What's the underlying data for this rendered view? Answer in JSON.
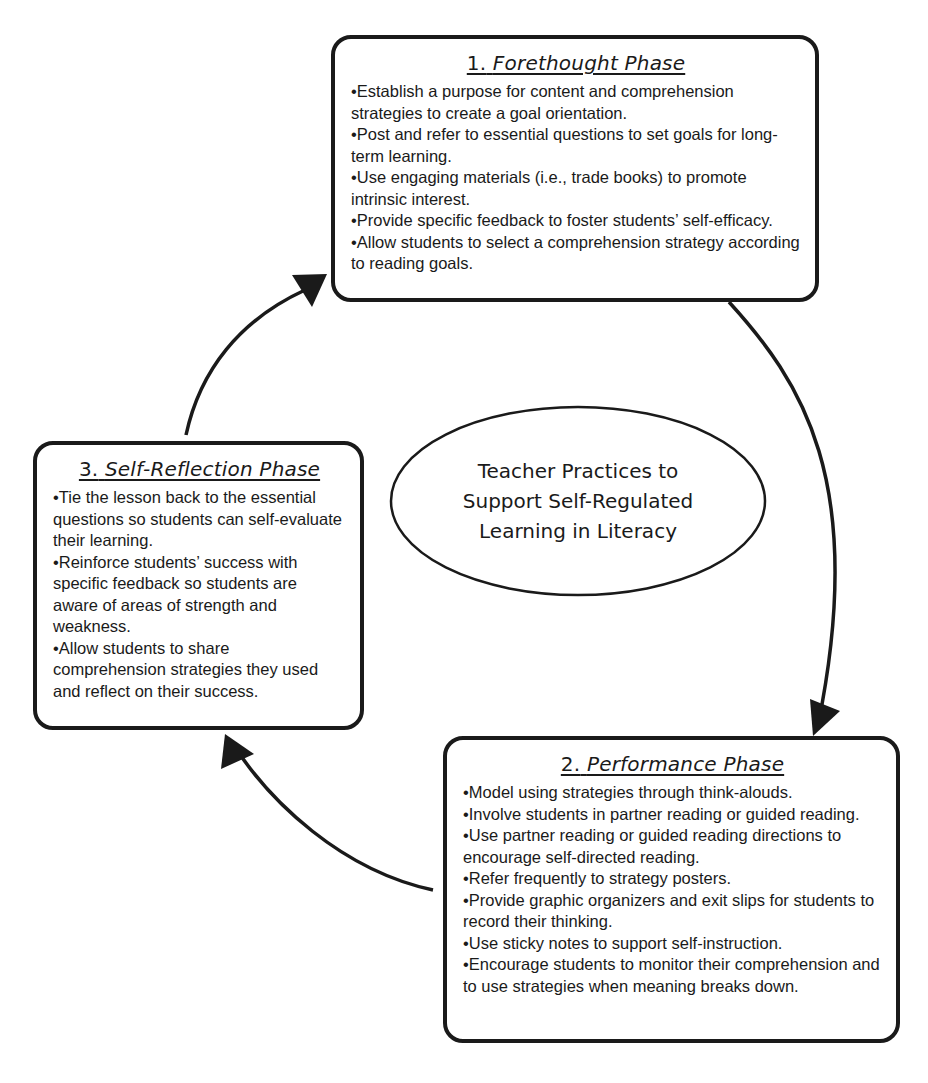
{
  "diagram": {
    "type": "cycle",
    "center": {
      "label": "Teacher Practices to Support Self-Regulated Learning in Literacy",
      "lines": [
        "Teacher Practices to",
        "Support Self-Regulated",
        "Learning in Literacy"
      ]
    },
    "phases": [
      {
        "number": "1.",
        "title": "Forethought Phase",
        "items": [
          "Establish a purpose for content and comprehension strategies to create a goal orientation.",
          "Post and refer to essential questions to set goals for long-term learning.",
          "Use engaging materials (i.e., trade books) to promote intrinsic interest.",
          "Provide specific feedback to foster students’ self-efficacy.",
          "Allow students to select a comprehension strategy according to reading goals."
        ]
      },
      {
        "number": "2.",
        "title": "Performance Phase",
        "items": [
          "Model using strategies through think-alouds.",
          "Involve students in partner reading or guided reading.",
          "Use partner reading or guided reading directions to encourage self-directed reading.",
          "Refer frequently to strategy posters.",
          "Provide graphic organizers and exit slips for students to record their thinking.",
          "Use sticky notes to support self-instruction.",
          "Encourage students to monitor their comprehension and to use strategies when meaning breaks down."
        ]
      },
      {
        "number": "3.",
        "title": "Self-Reflection Phase",
        "items": [
          "Tie the lesson back to the essential questions so students can self-evaluate their learning.",
          "Reinforce students’ success with specific feedback so students are aware of areas of strength and weakness.",
          "Allow students to share comprehension strategies they used and reflect on their success."
        ]
      }
    ],
    "arrows": [
      {
        "from": "1. Forethought Phase",
        "to": "2. Performance Phase"
      },
      {
        "from": "2. Performance Phase",
        "to": "3. Self-Reflection Phase"
      },
      {
        "from": "3. Self-Reflection Phase",
        "to": "1. Forethought Phase"
      }
    ],
    "colors": {
      "stroke": "#1a1a1a",
      "background": "#ffffff"
    }
  }
}
